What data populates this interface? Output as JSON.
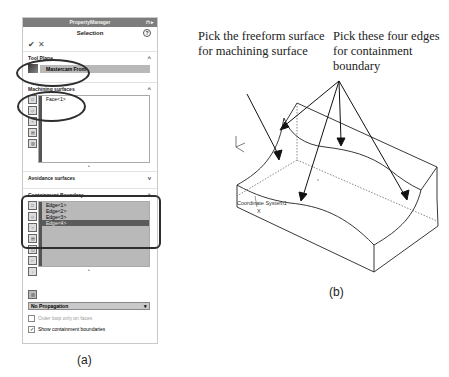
{
  "property_manager": {
    "title": "PropertyManager",
    "pin_icon": "pin-icon",
    "heading": "Selection",
    "help_icon": "?",
    "ok_icon": "✔",
    "cancel_icon": "✕",
    "tool_plane": {
      "label": "Tool Plane",
      "value": "Mastercam Front",
      "chevron": "^"
    },
    "machining_surfaces": {
      "label": "Machining surfaces",
      "chevron": "^",
      "items": [
        "Face<1>"
      ]
    },
    "avoidance_surfaces": {
      "label": "Avoidance surfaces",
      "chevron": "v"
    },
    "containment_boundary": {
      "label": "Containment Boundary",
      "chevron": "^",
      "items": [
        "Edge<1>",
        "Edge<2>",
        "Edge<3>",
        "Edge<4>"
      ],
      "selected_index": 3
    },
    "propagation": {
      "value": "No Propagation",
      "arrow": "▾"
    },
    "outer_loop": {
      "label": "Outer loop only on faces",
      "checked": false
    },
    "show_boundaries": {
      "label": "Show containment boundaries",
      "checked": true,
      "mark": "✓"
    }
  },
  "captions": {
    "a": "(a)",
    "b": "(b)"
  },
  "annotations": {
    "surface": "Pick the freeform surface for machining surface",
    "edges": "Pick these four edges for containment boundary"
  },
  "model": {
    "coordinate_label": "Coordinate System1",
    "axis_label": "X"
  }
}
